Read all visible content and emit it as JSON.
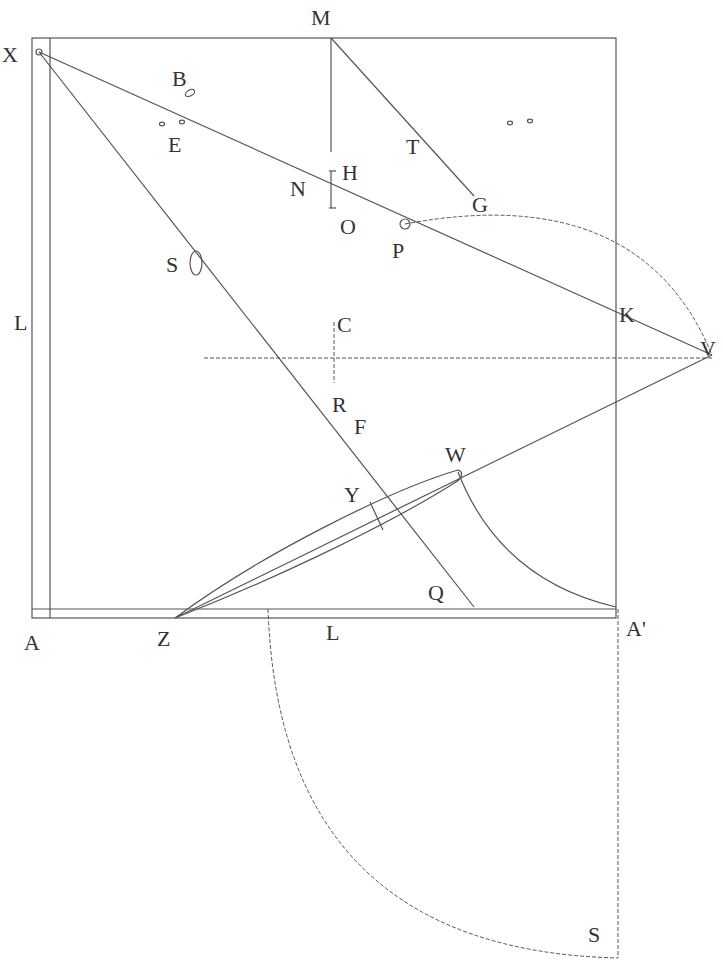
{
  "diagram": {
    "type": "geometric-construction",
    "labels": [
      {
        "id": "X",
        "text": "X",
        "x": 2,
        "y": 62
      },
      {
        "id": "M",
        "text": "M",
        "x": 311,
        "y": 25
      },
      {
        "id": "B",
        "text": "B",
        "x": 172,
        "y": 86
      },
      {
        "id": "E",
        "text": "E",
        "x": 168,
        "y": 152
      },
      {
        "id": "T",
        "text": "T",
        "x": 406,
        "y": 154
      },
      {
        "id": "H",
        "text": "H",
        "x": 342,
        "y": 180
      },
      {
        "id": "N",
        "text": "N",
        "x": 290,
        "y": 196
      },
      {
        "id": "G",
        "text": "G",
        "x": 472,
        "y": 212
      },
      {
        "id": "O",
        "text": "O",
        "x": 340,
        "y": 234
      },
      {
        "id": "P",
        "text": "P",
        "x": 392,
        "y": 258
      },
      {
        "id": "S1",
        "text": "S",
        "x": 166,
        "y": 272
      },
      {
        "id": "L1",
        "text": "L",
        "x": 14,
        "y": 330
      },
      {
        "id": "K",
        "text": "K",
        "x": 619,
        "y": 322
      },
      {
        "id": "C",
        "text": "C",
        "x": 337,
        "y": 332
      },
      {
        "id": "V",
        "text": "V",
        "x": 700,
        "y": 356
      },
      {
        "id": "R",
        "text": "R",
        "x": 332,
        "y": 412
      },
      {
        "id": "F",
        "text": "F",
        "x": 354,
        "y": 434
      },
      {
        "id": "W",
        "text": "W",
        "x": 445,
        "y": 462
      },
      {
        "id": "Y",
        "text": "Y",
        "x": 344,
        "y": 502
      },
      {
        "id": "Q",
        "text": "Q",
        "x": 428,
        "y": 600
      },
      {
        "id": "A",
        "text": "A",
        "x": 24,
        "y": 650
      },
      {
        "id": "Z",
        "text": "Z",
        "x": 157,
        "y": 646
      },
      {
        "id": "L2",
        "text": "L",
        "x": 326,
        "y": 640
      },
      {
        "id": "A-prime",
        "text": "A'",
        "x": 626,
        "y": 636
      },
      {
        "id": "S2",
        "text": "S",
        "x": 588,
        "y": 942
      }
    ]
  }
}
